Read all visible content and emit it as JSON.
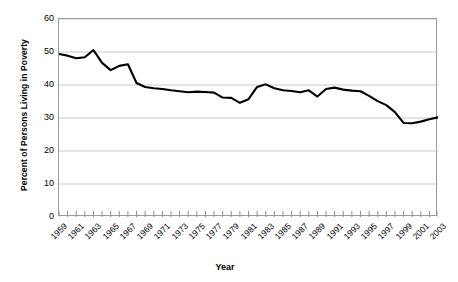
{
  "chart_data": {
    "type": "line",
    "title": "",
    "xlabel": "Year",
    "ylabel": "Percent of Persons Living in Poverty",
    "ylim": [
      0,
      60
    ],
    "ytick_values": [
      0,
      10,
      20,
      30,
      40,
      50,
      60
    ],
    "ytick_labels": [
      "0",
      "10",
      "20",
      "30",
      "40",
      "50",
      "60"
    ],
    "grid": "horizontal",
    "legend": "none",
    "x": [
      1959,
      1960,
      1961,
      1962,
      1963,
      1964,
      1965,
      1966,
      1967,
      1968,
      1969,
      1970,
      1971,
      1972,
      1973,
      1974,
      1975,
      1976,
      1977,
      1978,
      1979,
      1980,
      1981,
      1982,
      1983,
      1984,
      1985,
      1986,
      1987,
      1988,
      1989,
      1990,
      1991,
      1992,
      1993,
      1994,
      1995,
      1996,
      1997,
      1998,
      1999,
      2000,
      2001,
      2002,
      2003
    ],
    "xtick_labels": [
      "1959",
      "1961",
      "1963",
      "1965",
      "1967",
      "1969",
      "1971",
      "1973",
      "1975",
      "1977",
      "1979",
      "1981",
      "1983",
      "1985",
      "1987",
      "1989",
      "1991",
      "1993",
      "1995",
      "1997",
      "1999",
      "2001",
      "2003"
    ],
    "xlim": [
      1959,
      2003
    ],
    "series": [
      {
        "name": "Percent of Persons Living in Poverty",
        "color": "#000000",
        "values": [
          49.4,
          48.9,
          48.1,
          48.4,
          50.6,
          46.7,
          44.5,
          45.8,
          46.3,
          40.6,
          39.4,
          39.0,
          38.8,
          38.4,
          38.1,
          37.8,
          38.0,
          37.9,
          37.7,
          36.2,
          36.1,
          34.6,
          35.7,
          39.4,
          40.2,
          39.0,
          38.4,
          38.2,
          37.8,
          38.4,
          36.5,
          38.8,
          39.2,
          38.6,
          38.3,
          38.1,
          36.7,
          35.1,
          33.9,
          31.8,
          28.5,
          28.4,
          28.9,
          29.6,
          30.2
        ]
      }
    ]
  },
  "axis": {
    "y_title": "Percent of Persons Living in Poverty",
    "x_title": "Year"
  }
}
